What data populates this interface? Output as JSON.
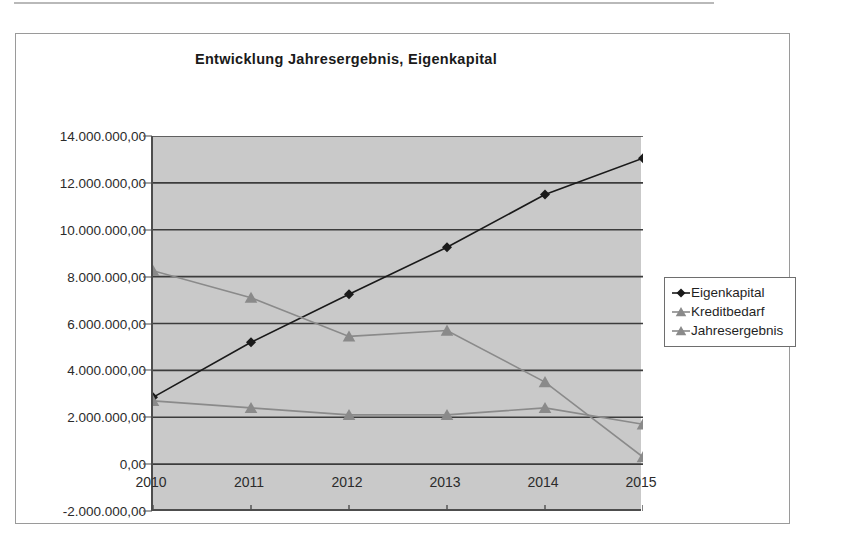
{
  "chart": {
    "title": "Entwicklung Jahresergebnis, Eigenkapital",
    "plot_bg": "#c9c9c9",
    "frame_border": "#9a9a9a"
  },
  "legend": {
    "items": [
      {
        "label": "Eigenkapital",
        "marker": "diamond-marker-icon",
        "color": "#1a1a1a"
      },
      {
        "label": "Kreditbedarf",
        "marker": "triangle-marker-icon",
        "color": "#8a8a8a"
      },
      {
        "label": "Jahresergebnis",
        "marker": "triangle-marker-icon",
        "color": "#8a8a8a"
      }
    ]
  },
  "axis": {
    "y_ticks": [
      "14.000.000,00",
      "12.000.000,00",
      "10.000.000,00",
      "8.000.000,00",
      "6.000.000,00",
      "4.000.000,00",
      "2.000.000,00",
      "0,00",
      "-2.000.000,00"
    ],
    "x_ticks": [
      "2010",
      "2011",
      "2012",
      "2013",
      "2014",
      "2015"
    ]
  },
  "chart_data": {
    "type": "line",
    "title": "Entwicklung Jahresergebnis, Eigenkapital",
    "xlabel": "",
    "ylabel": "",
    "categories": [
      "2010",
      "2011",
      "2012",
      "2013",
      "2014",
      "2015"
    ],
    "x": [
      2010,
      2011,
      2012,
      2013,
      2014,
      2015
    ],
    "ylim": [
      -2000000,
      14000000
    ],
    "ytick_step": 2000000,
    "ytick_values": [
      -2000000,
      0,
      2000000,
      4000000,
      6000000,
      8000000,
      10000000,
      12000000,
      14000000
    ],
    "ytick_labels": [
      "-2.000.000,00",
      "0,00",
      "2.000.000,00",
      "4.000.000,00",
      "6.000.000,00",
      "8.000.000,00",
      "10.000.000,00",
      "12.000.000,00",
      "14.000.000,00"
    ],
    "grid": true,
    "grid_axis": "y",
    "legend_position": "right",
    "series": [
      {
        "name": "Eigenkapital",
        "marker": "diamond",
        "color": "#1a1a1a",
        "values": [
          2850000,
          5200000,
          7250000,
          9250000,
          11500000,
          13050000
        ]
      },
      {
        "name": "Kreditbedarf",
        "marker": "triangle",
        "color": "#8a8a8a",
        "values": [
          8250000,
          7100000,
          5450000,
          5700000,
          3500000,
          300000
        ]
      },
      {
        "name": "Jahresergebnis",
        "marker": "triangle",
        "color": "#8a8a8a",
        "values": [
          2700000,
          2400000,
          2100000,
          2100000,
          2400000,
          1700000
        ]
      }
    ]
  }
}
